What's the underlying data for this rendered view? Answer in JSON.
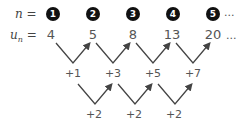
{
  "n_row": {
    "label_var": "n",
    "label_eq": "=",
    "indices": [
      "1",
      "2",
      "3",
      "4",
      "5"
    ],
    "ellipsis": "..."
  },
  "u_row": {
    "label_var": "u",
    "label_sub": "n",
    "label_eq": "=",
    "values": [
      "4",
      "5",
      "8",
      "13",
      "20"
    ],
    "ellipsis": "..."
  },
  "first_differences": [
    "+1",
    "+3",
    "+5",
    "+7"
  ],
  "second_differences": [
    "+2",
    "+2",
    "+2"
  ],
  "colors": {
    "circle_fill": "#111111",
    "arrow": "#444444",
    "text": "#555555"
  }
}
